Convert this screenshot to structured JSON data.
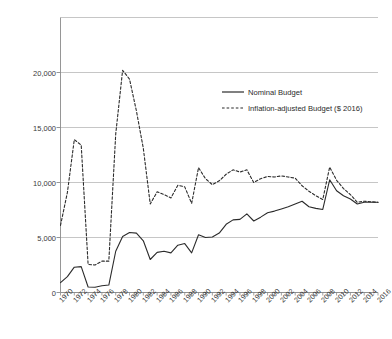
{
  "chart_data": {
    "type": "line",
    "title": "",
    "xlabel": "",
    "ylabel": "Millions of Dollars",
    "xlim": [
      1970,
      2016
    ],
    "ylim": [
      0,
      25000
    ],
    "ytick_labels": [
      "0",
      "5,000",
      "10,000",
      "15,000",
      "20,000"
    ],
    "ytick_values": [
      0,
      5000,
      10000,
      15000,
      20000
    ],
    "grid": "horizontal",
    "legend_position": "upper-right",
    "x": [
      1970,
      1971,
      1972,
      1973,
      1974,
      1975,
      1976,
      1977,
      1978,
      1979,
      1980,
      1981,
      1982,
      1983,
      1984,
      1985,
      1986,
      1987,
      1988,
      1989,
      1990,
      1991,
      1992,
      1993,
      1994,
      1995,
      1996,
      1997,
      1998,
      1999,
      2000,
      2001,
      2002,
      2003,
      2004,
      2005,
      2006,
      2007,
      2008,
      2009,
      2010,
      2011,
      2012,
      2013,
      2014,
      2015,
      2016
    ],
    "xtick_labels": [
      "1970",
      "1972",
      "1974",
      "1976",
      "1978",
      "1980",
      "1982",
      "1984",
      "1986",
      "1988",
      "1990",
      "1992",
      "1994",
      "1996",
      "1998",
      "2000",
      "2002",
      "2004",
      "2006",
      "2008",
      "2010",
      "2012",
      "2014",
      "2016"
    ],
    "series": [
      {
        "name": "Nominal Budget",
        "style": "solid",
        "color": "#2b2b2b",
        "values": [
          900,
          1450,
          2300,
          2350,
          500,
          480,
          620,
          680,
          3750,
          5100,
          5450,
          5400,
          4700,
          3000,
          3650,
          3750,
          3600,
          4300,
          4450,
          3600,
          5250,
          5000,
          5050,
          5400,
          6200,
          6600,
          6650,
          7150,
          6500,
          6850,
          7250,
          7400,
          7600,
          7800,
          8050,
          8300,
          7800,
          7650,
          7550,
          10250,
          9250,
          8800,
          8500,
          8050,
          8200,
          8200,
          8200
        ]
      },
      {
        "name": "Inflation-adjusted Budget ($ 2016)",
        "style": "dashed",
        "color": "#2b2b2b",
        "values": [
          6100,
          9100,
          13900,
          13400,
          2550,
          2500,
          2850,
          2850,
          14400,
          20200,
          19400,
          16500,
          13100,
          8050,
          9150,
          8900,
          8600,
          9750,
          9600,
          8100,
          11350,
          10350,
          9800,
          10150,
          10750,
          11150,
          10950,
          11150,
          10000,
          10350,
          10550,
          10500,
          10600,
          10500,
          10400,
          9700,
          9200,
          8800,
          8450,
          11400,
          10200,
          9450,
          8900,
          8200,
          8300,
          8250,
          8200
        ]
      }
    ]
  },
  "legend": {
    "items": [
      {
        "label": "Nominal Budget",
        "style": "solid"
      },
      {
        "label": "Inflation-adjusted Budget ($ 2016)",
        "style": "dashed"
      }
    ]
  }
}
